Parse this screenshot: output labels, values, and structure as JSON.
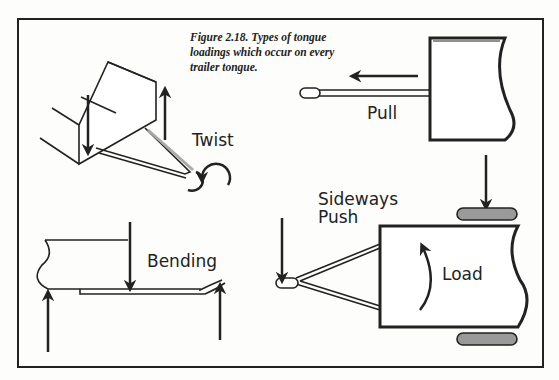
{
  "caption": "Figure 2.18.  Types of tongue loadings which occur on every trailer tongue.",
  "labels": {
    "twist": "Twist",
    "pull": "Pull",
    "bending": "Bending",
    "sideways_push_line1": "Sideways",
    "sideways_push_line2": "Push",
    "load": "Load"
  },
  "colors": {
    "ink": "#222222",
    "tire": "#9a9a9a",
    "paper": "#fdfdfb"
  }
}
